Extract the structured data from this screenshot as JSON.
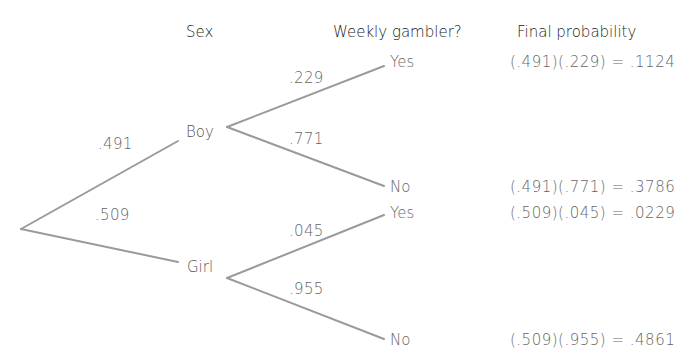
{
  "headers": {
    "sex": "Sex",
    "weekly_gambler": "Weekly gambler?",
    "final_probability": "Final probability"
  },
  "nodes": {
    "boy": "Boy",
    "girl": "Girl"
  },
  "branch_probs": {
    "boy": ".491",
    "girl": ".509",
    "boy_yes": ".229",
    "boy_no": ".771",
    "girl_yes": ".045",
    "girl_no": ".955"
  },
  "leaves": {
    "boy_yes": "Yes",
    "boy_no": "No",
    "girl_yes": "Yes",
    "girl_no": "No"
  },
  "final": {
    "boy_yes": "(.491)(.229) = .1124",
    "boy_no": "(.491)(.771) = .3786",
    "girl_yes": "(.509)(.045) = .0229",
    "girl_no": "(.509)(.955) = .4861"
  },
  "colors": {
    "line": "#9a9a9a",
    "header_text": "#222222",
    "label_text": "#666666"
  }
}
